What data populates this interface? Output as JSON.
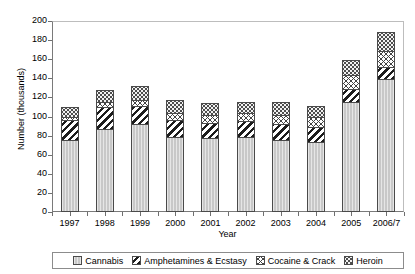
{
  "chart_data": {
    "type": "bar",
    "stacked": true,
    "title": "",
    "xlabel": "Year",
    "ylabel": "Number (thousands)",
    "categories": [
      "1997",
      "1998",
      "1999",
      "2000",
      "2001",
      "2002",
      "2003",
      "2004",
      "2005",
      "2006/7"
    ],
    "ylim": [
      0,
      200
    ],
    "yticks": [
      0,
      20,
      40,
      60,
      80,
      100,
      120,
      140,
      160,
      180,
      200
    ],
    "grid": false,
    "legend_position": "bottom",
    "series": [
      {
        "name": "Cannabis",
        "pattern": "light-grey-solid",
        "values": [
          75,
          87,
          92,
          79,
          77,
          79,
          75,
          73,
          115,
          139
        ]
      },
      {
        "name": "Amphetamines & Ecstasy",
        "pattern": "diagonal-hatch",
        "values": [
          21,
          23,
          19,
          17,
          16,
          16,
          17,
          16,
          14,
          13
        ]
      },
      {
        "name": "Cocaine & Crack",
        "pattern": "cross-hatch",
        "values": [
          3,
          5,
          6,
          8,
          9,
          9,
          10,
          10,
          14,
          17
        ]
      },
      {
        "name": "Heroin",
        "pattern": "dotted",
        "values": [
          11,
          13,
          15,
          13,
          12,
          11,
          13,
          12,
          16,
          20
        ]
      }
    ],
    "totals": [
      110,
      128,
      132,
      117,
      114,
      115,
      115,
      111,
      159,
      189
    ]
  },
  "axes": {
    "y_title": "Number (thousands)",
    "x_title": "Year",
    "y_tick_labels": [
      "0",
      "20",
      "40",
      "60",
      "80",
      "100",
      "120",
      "140",
      "160",
      "180",
      "200"
    ],
    "x_tick_labels": [
      "1997",
      "1998",
      "1999",
      "2000",
      "2001",
      "2002",
      "2003",
      "2004",
      "2005",
      "2006/7"
    ]
  },
  "legend": {
    "items": [
      {
        "label": "Cannabis",
        "icon": "legend-swatch-cannabis"
      },
      {
        "label": "Amphetamines & Ecstasy",
        "icon": "legend-swatch-amphetamines"
      },
      {
        "label": "Cocaine & Crack",
        "icon": "legend-swatch-cocaine"
      },
      {
        "label": "Heroin",
        "icon": "legend-swatch-heroin"
      }
    ]
  },
  "colors": {
    "cannabis": "#c8c8c8",
    "amphetamines": "#1c1c1c",
    "cocaine": "#444444",
    "heroin": "#4d4d4d",
    "axis": "#6f6f6f",
    "background": "#ffffff"
  }
}
